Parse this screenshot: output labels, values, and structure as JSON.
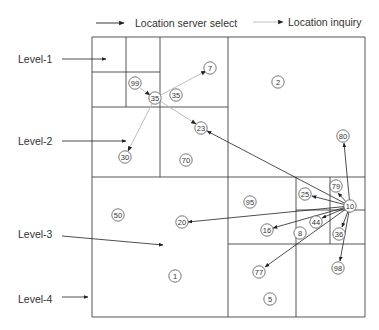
{
  "legend": {
    "select_label": "Location server select",
    "inquiry_label": "Location inquiry"
  },
  "colors": {
    "line": "#444444",
    "select_arrow": "#222222",
    "inquiry_arrow": "#b8b8b8",
    "text": "#333333"
  },
  "levels": [
    {
      "label": "Level-1",
      "x": 18,
      "y": 59,
      "arrow_from": [
        62,
        59
      ],
      "arrow_to": [
        106,
        59
      ]
    },
    {
      "label": "Level-2",
      "x": 18,
      "y": 141,
      "arrow_from": [
        62,
        141
      ],
      "arrow_to": [
        126,
        141
      ]
    },
    {
      "label": "Level-3",
      "x": 18,
      "y": 234,
      "arrow_from": [
        62,
        236
      ],
      "arrow_to": [
        163,
        245
      ]
    },
    {
      "label": "Level-4",
      "x": 18,
      "y": 299,
      "arrow_from": [
        62,
        297
      ],
      "arrow_to": [
        88,
        297
      ]
    }
  ],
  "grid_lines": [
    [
      92,
      37,
      365,
      37
    ],
    [
      365,
      37,
      365,
      317
    ],
    [
      365,
      317,
      92,
      317
    ],
    [
      92,
      317,
      92,
      37
    ],
    [
      228,
      37,
      228,
      317
    ],
    [
      92,
      177,
      365,
      177
    ],
    [
      160,
      37,
      160,
      177
    ],
    [
      92,
      107,
      228,
      107
    ],
    [
      126,
      37,
      126,
      107
    ],
    [
      92,
      72,
      160,
      72
    ],
    [
      296,
      177,
      296,
      317
    ],
    [
      228,
      244,
      365,
      244
    ],
    [
      330,
      177,
      330,
      244
    ],
    [
      296,
      210,
      365,
      210
    ]
  ],
  "nodes": [
    {
      "id": "7",
      "x": 210,
      "y": 68
    },
    {
      "id": "99",
      "x": 135,
      "y": 83
    },
    {
      "id": "35a",
      "label": "35",
      "x": 155,
      "y": 98
    },
    {
      "id": "35b",
      "label": "35",
      "x": 176,
      "y": 95
    },
    {
      "id": "2",
      "x": 278,
      "y": 82
    },
    {
      "id": "23",
      "x": 201,
      "y": 128
    },
    {
      "id": "30",
      "x": 125,
      "y": 157
    },
    {
      "id": "70",
      "x": 186,
      "y": 160
    },
    {
      "id": "80",
      "x": 343,
      "y": 136
    },
    {
      "id": "79",
      "x": 336,
      "y": 186
    },
    {
      "id": "25",
      "x": 305,
      "y": 194
    },
    {
      "id": "95",
      "x": 250,
      "y": 202
    },
    {
      "id": "10",
      "x": 350,
      "y": 206
    },
    {
      "id": "50",
      "x": 118,
      "y": 215
    },
    {
      "id": "20",
      "x": 182,
      "y": 222
    },
    {
      "id": "44",
      "x": 316,
      "y": 222
    },
    {
      "id": "16",
      "x": 267,
      "y": 230
    },
    {
      "id": "8",
      "x": 300,
      "y": 233
    },
    {
      "id": "36",
      "x": 339,
      "y": 234
    },
    {
      "id": "98",
      "x": 338,
      "y": 268
    },
    {
      "id": "77",
      "x": 259,
      "y": 272
    },
    {
      "id": "1",
      "x": 175,
      "y": 276
    },
    {
      "id": "5",
      "x": 270,
      "y": 299
    }
  ],
  "select_arrows": [
    {
      "from": [
        350,
        206
      ],
      "to": [
        207,
        131
      ]
    },
    {
      "from": [
        350,
        206
      ],
      "to": [
        344,
        143
      ]
    },
    {
      "from": [
        350,
        206
      ],
      "to": [
        338,
        193
      ]
    },
    {
      "from": [
        350,
        206
      ],
      "to": [
        312,
        196
      ]
    },
    {
      "from": [
        350,
        206
      ],
      "to": [
        188,
        222
      ]
    },
    {
      "from": [
        350,
        206
      ],
      "to": [
        322,
        218
      ]
    },
    {
      "from": [
        350,
        206
      ],
      "to": [
        273,
        228
      ]
    },
    {
      "from": [
        350,
        206
      ],
      "to": [
        342,
        227
      ]
    },
    {
      "from": [
        350,
        206
      ],
      "to": [
        340,
        261
      ]
    },
    {
      "from": [
        350,
        206
      ],
      "to": [
        265,
        267
      ]
    }
  ],
  "inquiry_arrows": [
    {
      "from": [
        140,
        88
      ],
      "to": [
        150,
        95
      ]
    },
    {
      "from": [
        155,
        98
      ],
      "to": [
        206,
        71
      ]
    },
    {
      "from": [
        155,
        98
      ],
      "to": [
        128,
        151
      ]
    },
    {
      "from": [
        160,
        101
      ],
      "to": [
        196,
        124
      ]
    }
  ]
}
